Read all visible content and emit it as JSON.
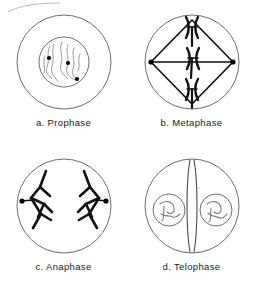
{
  "figure": {
    "background_color": "#ffffff",
    "membrane_stroke": "#6e6e6e",
    "chromosome_stroke": "#111111",
    "chromatin_stroke": "#8a8a8a",
    "centromere_fill": "#000000",
    "panels": [
      {
        "id": "prophase",
        "letter": "a.",
        "name": "Prophase",
        "caption": "a.  Prophase",
        "structures": [
          "cell-membrane-circle",
          "nuclear-envelope-circle",
          "chromatin-threads",
          "centromere-dots"
        ],
        "centromere_count": 3,
        "chromatin_thread_count": 6
      },
      {
        "id": "metaphase",
        "letter": "b.",
        "name": "Metaphase",
        "caption": "b.  Metaphase",
        "structures": [
          "cell-membrane-circle",
          "spindle-diamond",
          "spindle-equator-line",
          "spindle-pole-dots",
          "chromosomes-x-shaped"
        ],
        "chromosome_count": 3,
        "spindle_pole_count": 2
      },
      {
        "id": "anaphase",
        "letter": "c.",
        "name": "Anaphase",
        "caption": "c.  Anaphase",
        "structures": [
          "cell-membrane-circle",
          "spindle-pole-dots",
          "chromosomes-v-shaped-left",
          "chromosomes-v-shaped-right"
        ],
        "chromosome_count": 6,
        "spindle_pole_count": 2
      },
      {
        "id": "telophase",
        "letter": "d.",
        "name": "Telophase",
        "caption": "d.  Telophase",
        "structures": [
          "cell-membrane-circle",
          "cleavage-furrow",
          "daughter-nucleus-left",
          "daughter-nucleus-right",
          "chromatin-threads"
        ],
        "daughter_nuclei_count": 2
      }
    ]
  }
}
